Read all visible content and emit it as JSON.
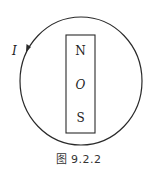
{
  "figure": {
    "current_label": "I",
    "magnet": {
      "north_label": "N",
      "center_label": "O",
      "south_label": "S"
    },
    "caption": "图 9.2.2",
    "colors": {
      "stroke": "#2a2a2a",
      "text": "#222222",
      "background": "#ffffff"
    }
  }
}
